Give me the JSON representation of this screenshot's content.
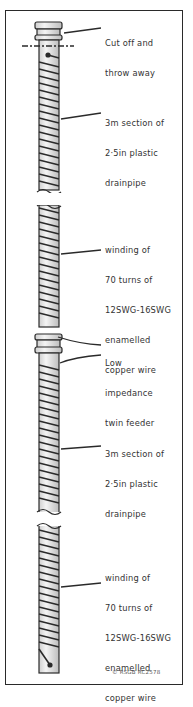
{
  "diagram": {
    "colors": {
      "ink": "#2a2a2a",
      "pipe_fill": "#e8e8e8",
      "background": "#ffffff"
    },
    "labels": [
      {
        "id": "cut-off",
        "lines": [
          "Cut off and",
          "throw away"
        ]
      },
      {
        "id": "pipe-upper",
        "lines": [
          "3m section of",
          "2·5in plastic",
          "drainpipe"
        ]
      },
      {
        "id": "winding-upper",
        "lines": [
          "winding of",
          "70 turns of",
          "12SWG-16SWG",
          "enamelled",
          "copper wire"
        ]
      },
      {
        "id": "feeder",
        "lines": [
          "Low",
          "impedance",
          "twin feeder"
        ]
      },
      {
        "id": "pipe-lower",
        "lines": [
          "3m section of",
          "2·5in plastic",
          "drainpipe"
        ]
      },
      {
        "id": "winding-lower",
        "lines": [
          "winding of",
          "70 turns of",
          "12SWG-16SWG",
          "enamelled",
          "copper wire"
        ]
      }
    ],
    "credit": "© RSGB RC2578"
  }
}
